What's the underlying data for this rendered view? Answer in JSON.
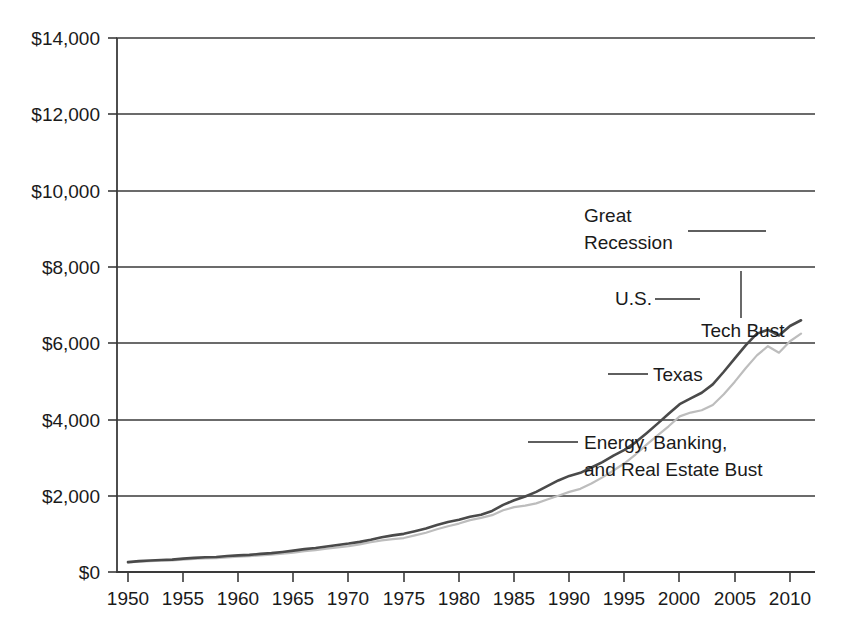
{
  "chart_data": {
    "type": "line",
    "title": "",
    "subtitle": "",
    "xlabel": "",
    "ylabel": "",
    "xlim": [
      1950,
      2011
    ],
    "ylim": [
      0,
      14000
    ],
    "grid": true,
    "grid_axis": "y",
    "legend_position": "inline-annotations",
    "value_prefix": "$",
    "y_ticks": [
      0,
      2000,
      4000,
      6000,
      8000,
      10000,
      12000,
      14000
    ],
    "y_tick_labels": [
      "$0",
      "$2,000",
      "$4,000",
      "$6,000",
      "$8,000",
      "$10,000",
      "$12,000",
      "$14,000"
    ],
    "x_ticks": [
      1950,
      1955,
      1960,
      1965,
      1970,
      1975,
      1980,
      1985,
      1990,
      1995,
      2000,
      2005,
      2010
    ],
    "x_tick_labels": [
      "1950",
      "1955",
      "1960",
      "1965",
      "1970",
      "1975",
      "1980",
      "1985",
      "1990",
      "1995",
      "2000",
      "2005",
      "2010"
    ],
    "colors": {
      "us_line": "#4a4a4a",
      "texas_line": "#bdbdbd",
      "axis": "#3a3a3a",
      "text": "#1a1a1a",
      "background": "#ffffff"
    },
    "series": [
      {
        "name": "U.S.",
        "color": "#4a4a4a",
        "x": [
          1950,
          1951,
          1952,
          1953,
          1954,
          1955,
          1956,
          1957,
          1958,
          1959,
          1960,
          1961,
          1962,
          1963,
          1964,
          1965,
          1966,
          1967,
          1968,
          1969,
          1970,
          1971,
          1972,
          1973,
          1974,
          1975,
          1976,
          1977,
          1978,
          1979,
          1980,
          1981,
          1982,
          1983,
          1984,
          1985,
          1986,
          1987,
          1988,
          1989,
          1990,
          1991,
          1992,
          1993,
          1994,
          1995,
          1996,
          1997,
          1998,
          1999,
          2000,
          2001,
          2002,
          2003,
          2004,
          2005,
          2006,
          2007,
          2008,
          2009,
          2010,
          2011
        ],
        "values": [
          260,
          285,
          300,
          315,
          325,
          350,
          370,
          385,
          395,
          420,
          435,
          450,
          475,
          495,
          525,
          560,
          600,
          630,
          670,
          710,
          745,
          790,
          845,
          910,
          960,
          1000,
          1070,
          1140,
          1230,
          1310,
          1370,
          1450,
          1500,
          1600,
          1760,
          1880,
          1980,
          2100,
          2250,
          2400,
          2520,
          2600,
          2740,
          2880,
          3050,
          3200,
          3400,
          3640,
          3890,
          4150,
          4400,
          4550,
          4700,
          4920,
          5250,
          5600,
          5950,
          6250,
          6350,
          6200,
          6450,
          6600
        ]
      },
      {
        "name": "Texas",
        "color": "#bdbdbd",
        "x": [
          1950,
          1951,
          1952,
          1953,
          1954,
          1955,
          1956,
          1957,
          1958,
          1959,
          1960,
          1961,
          1962,
          1963,
          1964,
          1965,
          1966,
          1967,
          1968,
          1969,
          1970,
          1971,
          1972,
          1973,
          1974,
          1975,
          1976,
          1977,
          1978,
          1979,
          1980,
          1981,
          1982,
          1983,
          1984,
          1985,
          1986,
          1987,
          1988,
          1989,
          1990,
          1991,
          1992,
          1993,
          1994,
          1995,
          1996,
          1997,
          1998,
          1999,
          2000,
          2001,
          2002,
          2003,
          2004,
          2005,
          2006,
          2007,
          2008,
          2009,
          2010,
          2011
        ],
        "values": [
          250,
          270,
          285,
          295,
          305,
          325,
          345,
          355,
          365,
          385,
          400,
          415,
          435,
          455,
          480,
          510,
          545,
          575,
          610,
          645,
          680,
          725,
          780,
          830,
          860,
          890,
          960,
          1030,
          1120,
          1200,
          1270,
          1360,
          1420,
          1490,
          1620,
          1700,
          1740,
          1800,
          1900,
          2000,
          2100,
          2180,
          2320,
          2480,
          2660,
          2850,
          3080,
          3340,
          3580,
          3820,
          4080,
          4180,
          4240,
          4380,
          4660,
          4990,
          5350,
          5680,
          5920,
          5750,
          6050,
          6250
        ]
      }
    ],
    "annotations": [
      {
        "id": "great-recession",
        "lines": [
          "Great",
          "Recession"
        ],
        "text": "Great Recession"
      },
      {
        "id": "us-label",
        "lines": [
          "U.S."
        ],
        "text": "U.S."
      },
      {
        "id": "tech-bust",
        "lines": [
          "Tech Bust"
        ],
        "text": "Tech Bust"
      },
      {
        "id": "texas-label",
        "lines": [
          "Texas"
        ],
        "text": "Texas"
      },
      {
        "id": "energy-banking-bust",
        "lines": [
          "Energy, Banking,",
          "and Real Estate Bust"
        ],
        "text": "Energy, Banking, and Real Estate Bust"
      }
    ]
  }
}
